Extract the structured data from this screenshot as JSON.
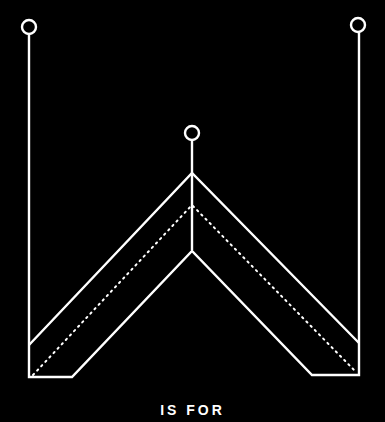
{
  "illustration": {
    "subject": "letter-W-line-art",
    "background": "#000000",
    "stroke": "#ffffff"
  },
  "caption": {
    "text": "IS FOR"
  }
}
